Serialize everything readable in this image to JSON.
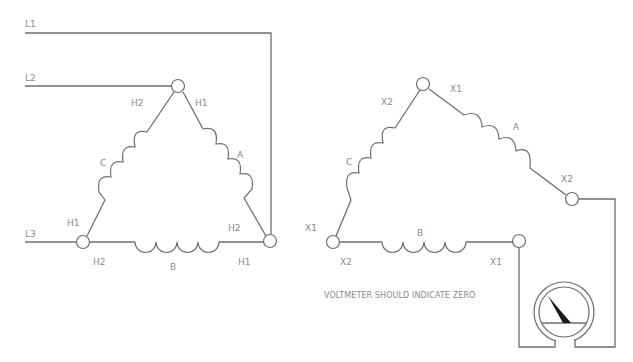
{
  "diagram": {
    "type": "delta-delta transformer polarity check wiring",
    "colors": {
      "line": "#6e6e6e",
      "text": "#8a8a8a",
      "needle": "#1a1a1a"
    },
    "left_delta": {
      "lines": {
        "l1": "L1",
        "l2": "L2",
        "l3": "L3"
      },
      "coils": {
        "a": "A",
        "b": "B",
        "c": "C"
      },
      "terminals": {
        "top_left": "H2",
        "top_right": "H1",
        "left_upper": "H1",
        "left_lower": "H2",
        "right_upper": "H2",
        "right_lower": "H1"
      }
    },
    "right_delta": {
      "coils": {
        "a": "A",
        "b": "B",
        "c": "C"
      },
      "terminals": {
        "top_left": "X2",
        "top_right": "X1",
        "right_x2": "X2",
        "left_upper": "X1",
        "left_lower": "X2",
        "bottom_right": "X1"
      }
    },
    "caption": "VOLTMETER SHOULD INDICATE ZERO",
    "meter": {
      "name": "voltmeter"
    }
  }
}
